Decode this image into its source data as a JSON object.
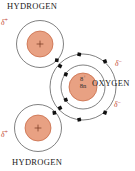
{
  "diagram": {
    "background_color": "#ffffff",
    "nucleus_fill": "#e8a183",
    "nucleus_stroke": "#c4613c",
    "shell_stroke": "#4a4a4a",
    "electron_color": "#111111",
    "charge_color": "#c0392b",
    "label_color": "#1a1a1a"
  },
  "labels": {
    "hydrogen_top": "HYDROGEN",
    "hydrogen_bottom": "HYDROGEN",
    "oxygen": "OXYGEN"
  },
  "charges": {
    "hydrogen_top": "δ",
    "hydrogen_top_sign": "+",
    "hydrogen_bottom": "δ",
    "hydrogen_bottom_sign": "+",
    "oxygen_top": "δ",
    "oxygen_top_sign": "−",
    "oxygen_bottom": "δ",
    "oxygen_bottom_sign": "−"
  },
  "nucleus": {
    "oxygen_protons": "8",
    "oxygen_protons_sign": "+",
    "oxygen_neutrons": "8n",
    "hydrogen_marker": "+"
  },
  "atoms": [
    {
      "name": "hydrogen-top",
      "element": "H",
      "cx": 40,
      "cy": 44,
      "nucleus_r": 13,
      "shells": [
        23
      ],
      "electrons": 1
    },
    {
      "name": "hydrogen-bottom",
      "element": "H",
      "cx": 38,
      "cy": 128,
      "nucleus_r": 13,
      "shells": [
        23
      ],
      "electrons": 1
    },
    {
      "name": "oxygen",
      "element": "O",
      "cx": 83,
      "cy": 87,
      "nucleus_r": 14,
      "shells": [
        22,
        33
      ],
      "electrons_inner": 2,
      "electrons_outer": 6
    }
  ],
  "electron_dots": {
    "shape": "square",
    "size": 3.4,
    "inner_shell_count": 2,
    "outer_shell_count": 8,
    "hydrogen_shell_count": 1
  }
}
